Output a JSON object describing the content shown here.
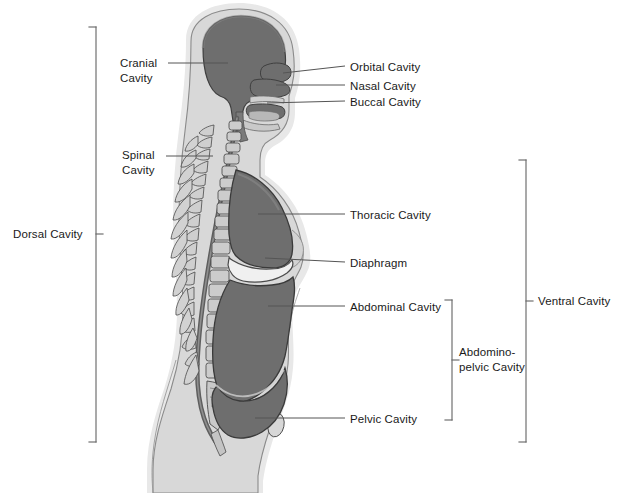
{
  "figure": {
    "colors": {
      "cavity_fill": "#6e6e6e",
      "body_fill": "#d8d8d8",
      "bone_fill": "#c3c3c3",
      "outline": "#3a3a3a",
      "leader_line": "#555555",
      "text": "#1a1a1a",
      "background": "#ffffff"
    }
  },
  "labels_left": [
    {
      "id": "cranial-cavity",
      "text": "Cranial\nCavity",
      "x": 120,
      "y": 56
    },
    {
      "id": "spinal-cavity",
      "text": "Spinal\nCavity",
      "x": 122,
      "y": 148
    },
    {
      "id": "dorsal-cavity",
      "text": "Dorsal Cavity",
      "x": 13,
      "y": 227
    }
  ],
  "labels_right": [
    {
      "id": "orbital-cavity",
      "text": "Orbital Cavity",
      "x": 350,
      "y": 60
    },
    {
      "id": "nasal-cavity",
      "text": "Nasal Cavity",
      "x": 350,
      "y": 79
    },
    {
      "id": "buccal-cavity",
      "text": "Buccal Cavity",
      "x": 350,
      "y": 95
    },
    {
      "id": "thoracic-cavity",
      "text": "Thoracic Cavity",
      "x": 350,
      "y": 208
    },
    {
      "id": "diaphragm",
      "text": "Diaphragm",
      "x": 350,
      "y": 256
    },
    {
      "id": "abdominal-cavity",
      "text": "Abdominal Cavity",
      "x": 350,
      "y": 300
    },
    {
      "id": "pelvic-cavity",
      "text": "Pelvic Cavity",
      "x": 350,
      "y": 412
    }
  ],
  "labels_bracket": [
    {
      "id": "abdominopelvic-cavity",
      "text": "Abdomino-\npelvic Cavity",
      "x": 459,
      "y": 345
    },
    {
      "id": "ventral-cavity",
      "text": "Ventral Cavity",
      "x": 538,
      "y": 294
    }
  ],
  "brackets": [
    {
      "id": "dorsal-cavity-bracket",
      "x": 96,
      "top": 27,
      "bottom": 442,
      "tick": "right",
      "tick_y": 234
    },
    {
      "id": "abdominopelvic-cavity-bracket",
      "x": 452,
      "top": 300,
      "bottom": 420,
      "tick": "right",
      "tick_y": 360
    },
    {
      "id": "ventral-cavity-bracket",
      "x": 526,
      "top": 160,
      "bottom": 442,
      "tick": "right",
      "tick_y": 301
    }
  ],
  "leaders": [
    {
      "id": "leader-cranial",
      "x1": 168,
      "y1": 63,
      "x2": 228,
      "y2": 63
    },
    {
      "id": "leader-spinal",
      "x1": 166,
      "y1": 156,
      "x2": 213,
      "y2": 156
    },
    {
      "id": "leader-orbital",
      "x1": 345,
      "y1": 66,
      "x2": 283,
      "y2": 73
    },
    {
      "id": "leader-nasal",
      "x1": 345,
      "y1": 85,
      "x2": 276,
      "y2": 85
    },
    {
      "id": "leader-buccal",
      "x1": 345,
      "y1": 101,
      "x2": 267,
      "y2": 103
    },
    {
      "id": "leader-thoracic",
      "x1": 345,
      "y1": 214,
      "x2": 258,
      "y2": 214
    },
    {
      "id": "leader-diaphragm",
      "x1": 345,
      "y1": 262,
      "x2": 265,
      "y2": 258
    },
    {
      "id": "leader-abdominal",
      "x1": 345,
      "y1": 306,
      "x2": 268,
      "y2": 306
    },
    {
      "id": "leader-pelvic",
      "x1": 345,
      "y1": 418,
      "x2": 255,
      "y2": 418
    }
  ]
}
